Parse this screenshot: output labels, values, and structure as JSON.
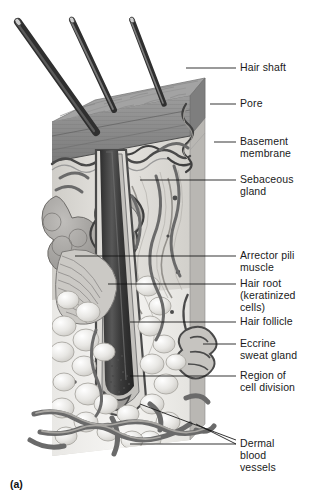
{
  "figure": {
    "caption": "(a)",
    "style": "grayscale-anatomical-illustration"
  },
  "palette": {
    "ink": "#1a1a1a",
    "leader": "#111111",
    "epidermis_top": "#8d8d8d",
    "epidermis_band": "#6f6f6f",
    "dermis": "#d8d6d2",
    "hypodermis": "#efeeec",
    "hair": "#3a3a3a",
    "vessel": "#5f5f5f",
    "gland": "#9a9a9a",
    "background": "#ffffff"
  },
  "labels": [
    {
      "id": "hair-shaft",
      "text": "Hair shaft",
      "top": 62,
      "lx1": 186,
      "ly1": 68,
      "lx2": 236,
      "ly2": 68,
      "ax": 140,
      "ay": 48
    },
    {
      "id": "pore",
      "text": "Pore",
      "top": 98,
      "lx1": 210,
      "ly1": 104,
      "lx2": 236,
      "ly2": 104,
      "ax": 196,
      "ay": 104
    },
    {
      "id": "basement-membrane",
      "text": "Basement\nmembrane",
      "top": 136,
      "lx1": 214,
      "ly1": 142,
      "lx2": 236,
      "ly2": 142,
      "ax": 190,
      "ay": 148
    },
    {
      "id": "sebaceous-gland",
      "text": "Sebaceous\ngland",
      "top": 174,
      "lx1": 140,
      "ly1": 180,
      "lx2": 236,
      "ly2": 180,
      "ax": 140,
      "ay": 180
    },
    {
      "id": "arrector-pili",
      "text": "Arrector pili\nmuscle",
      "top": 250,
      "lx1": 75,
      "ly1": 256,
      "lx2": 236,
      "ly2": 256,
      "ax": 75,
      "ay": 256
    },
    {
      "id": "hair-root",
      "text": "Hair root\n(keratinized\ncells)",
      "top": 278,
      "lx1": 108,
      "ly1": 284,
      "lx2": 236,
      "ly2": 284,
      "ax": 108,
      "ay": 284
    },
    {
      "id": "hair-follicle",
      "text": "Hair follicle",
      "top": 316,
      "lx1": 130,
      "ly1": 322,
      "lx2": 236,
      "ly2": 322,
      "ax": 130,
      "ay": 322
    },
    {
      "id": "eccrine-sweat-gland",
      "text": "Eccrine\nsweat gland",
      "top": 338,
      "lx1": 203,
      "ly1": 344,
      "lx2": 236,
      "ly2": 344,
      "ax": 196,
      "ay": 352
    },
    {
      "id": "region-cell-division",
      "text": "Region of\ncell division",
      "top": 370,
      "lx1": 130,
      "ly1": 376,
      "lx2": 236,
      "ly2": 376,
      "ax": 130,
      "ay": 376
    },
    {
      "id": "dermal-blood-vessels",
      "text": "Dermal\nblood\nvessels",
      "top": 438,
      "lx1": 130,
      "ly1": 444,
      "lx2": 236,
      "ly2": 444,
      "ax": 130,
      "ay": 444
    }
  ],
  "leaders_extra": [
    {
      "id": "dermal-vessel-upper",
      "x1": 140,
      "y1": 404,
      "x2": 236,
      "y2": 440
    },
    {
      "id": "dermal-vessel-lower",
      "x1": 196,
      "y1": 424,
      "x2": 236,
      "y2": 444
    }
  ],
  "hair_shafts": [
    {
      "id": "shaft-left",
      "x1": 20,
      "y1": 22,
      "x2": 92,
      "y2": 126,
      "w": 7
    },
    {
      "id": "shaft-middle",
      "x1": 72,
      "y1": 20,
      "x2": 112,
      "y2": 106,
      "w": 5
    },
    {
      "id": "shaft-right",
      "x1": 131,
      "y1": 20,
      "x2": 163,
      "y2": 100,
      "w": 5
    }
  ]
}
